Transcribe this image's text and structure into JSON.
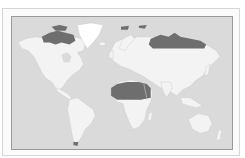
{
  "map": {
    "type": "world-map",
    "projection": "equirectangular-like",
    "colors": {
      "ocean": "#dadada",
      "land": "#f3f3f3",
      "highlight": "#6e6e6e",
      "frame": "#d6d6d6",
      "border": "#9a9a9a",
      "coast": "#c8c8c8"
    },
    "highlighted_regions": [
      "canadian-arctic-archipelago",
      "northern-russia-siberia",
      "sahara",
      "svalbard",
      "franz-josef-land",
      "tierra-del-fuego"
    ],
    "regions": [
      "north-america",
      "greenland",
      "south-america",
      "europe",
      "africa",
      "asia",
      "australia",
      "antarctic-islands"
    ]
  }
}
